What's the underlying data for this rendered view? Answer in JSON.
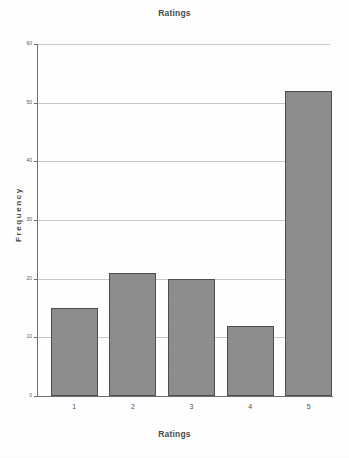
{
  "chart_data": {
    "type": "bar",
    "title": "Ratings",
    "xlabel": "Ratings",
    "ylabel": "Frequency",
    "categories": [
      "1",
      "2",
      "3",
      "4",
      "5"
    ],
    "values": [
      15,
      21,
      20,
      12,
      52
    ],
    "ylim": [
      0,
      60
    ],
    "yticks": [
      0,
      10,
      20,
      30,
      40,
      50,
      60
    ],
    "ytick_labels": [
      "0",
      "10",
      "20",
      "30",
      "40",
      "50",
      "60"
    ],
    "grid": true,
    "legend": false,
    "bar_color": "#8d8d8d",
    "bar_edge_color": "#4e4e4e",
    "gridline_color": "#c8c8c8",
    "axis_color": "#6f6f6f",
    "background_color": "#ffffff"
  }
}
